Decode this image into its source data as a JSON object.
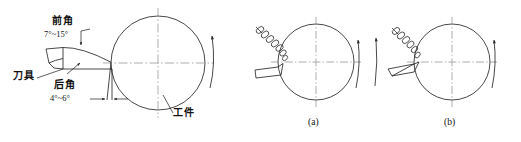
{
  "figure": {
    "type": "technical-diagram",
    "background_color": "#ffffff",
    "line_color": "#1a1a1a",
    "centerline_color": "#888888"
  },
  "left_diagram": {
    "name": "tool-geometry",
    "labels": {
      "rake_angle_title": "前角",
      "rake_angle_value": "7°~15°",
      "clearance_angle_title": "后角",
      "clearance_angle_value": "4°~6°",
      "tool_label": "刀具",
      "workpiece_label": "工件"
    },
    "icons": {
      "rotation": "rotation-arrow-icon",
      "leader": "leader-line-icon",
      "dimension": "dimension-arrow-icon"
    }
  },
  "sub_diagrams": [
    {
      "name": "diagram-a",
      "caption": "(a)",
      "chip": "coiled-chip-icon",
      "rotation": "rotation-arrow-icon"
    },
    {
      "name": "diagram-b",
      "caption": "(b)",
      "chip": "coiled-chip-icon",
      "rotation": "rotation-arrow-icon"
    }
  ]
}
